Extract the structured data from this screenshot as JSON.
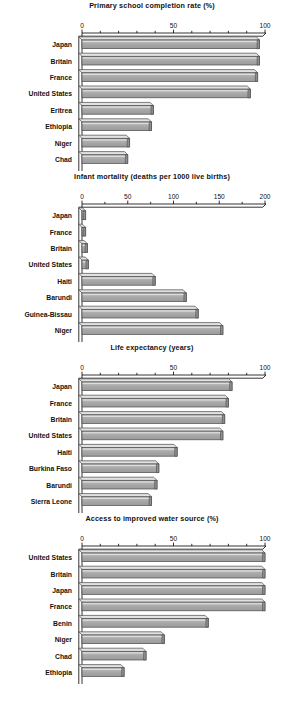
{
  "figure": {
    "background_color": "#ffffff",
    "bar_fill_color": "#a9a9a9",
    "bar_top_color": "#d6d6d6",
    "bar_edge_color": "#4a4a4a",
    "axis_color": "#000000"
  },
  "charts": [
    {
      "id": "primary-school-completion-rate",
      "chart_data": {
        "type": "bar",
        "orientation": "horizontal",
        "title": "Primary school completion rate (%)",
        "xlabel": "",
        "ylabel": "",
        "xlim": [
          0,
          100
        ],
        "xticks": [
          0,
          50,
          100
        ],
        "xtick_labels": [
          "0",
          "50",
          "100"
        ],
        "minor_tick_step": 10,
        "grid": false,
        "legend": false,
        "categories": [
          "Japan",
          "Britain",
          "France",
          "United States",
          "Eritrea",
          "Ethiopia",
          "Niger",
          "Chad"
        ],
        "values": [
          97,
          97,
          96,
          92,
          39,
          38,
          26,
          25
        ]
      }
    },
    {
      "id": "infant-mortality",
      "chart_data": {
        "type": "bar",
        "orientation": "horizontal",
        "title": "Infant mortality (deaths per 1000 live births)",
        "xlabel": "",
        "ylabel": "",
        "xlim": [
          0,
          200
        ],
        "xticks": [
          0,
          50,
          100,
          150,
          200
        ],
        "xtick_labels": [
          "0",
          "50",
          "100",
          "150",
          "200"
        ],
        "minor_tick_step": 25,
        "grid": false,
        "legend": false,
        "categories": [
          "Japan",
          "France",
          "Britain",
          "United States",
          "Haiti",
          "Barundi",
          "Guinea-Bissau",
          "Niger"
        ],
        "values": [
          4,
          4,
          6,
          7,
          80,
          114,
          127,
          154
        ]
      }
    },
    {
      "id": "life-expectancy",
      "chart_data": {
        "type": "bar",
        "orientation": "horizontal",
        "title": "Life expectancy (years)",
        "xlabel": "",
        "ylabel": "",
        "xlim": [
          0,
          100
        ],
        "xticks": [
          0,
          50,
          100
        ],
        "xtick_labels": [
          "0",
          "50",
          "100"
        ],
        "minor_tick_step": 10,
        "grid": false,
        "legend": false,
        "categories": [
          "Japan",
          "France",
          "Britain",
          "United States",
          "Haiti",
          "Burkina Faso",
          "Barundi",
          "Sierra Leone"
        ],
        "values": [
          82,
          80,
          78,
          77,
          52,
          42,
          41,
          38
        ]
      }
    },
    {
      "id": "access-to-improved-water-source",
      "chart_data": {
        "type": "bar",
        "orientation": "horizontal",
        "title": "Access to improved water source (%)",
        "xlabel": "",
        "ylabel": "",
        "xlim": [
          0,
          100
        ],
        "xticks": [
          0,
          50,
          100
        ],
        "xtick_labels": [
          "0",
          "50",
          "100"
        ],
        "minor_tick_step": 10,
        "grid": false,
        "legend": false,
        "categories": [
          "United States",
          "Britain",
          "Japan",
          "France",
          "Benin",
          "Niger",
          "Chad",
          "Ethiopia"
        ],
        "values": [
          100,
          100,
          100,
          100,
          69,
          45,
          35,
          23
        ]
      }
    }
  ]
}
